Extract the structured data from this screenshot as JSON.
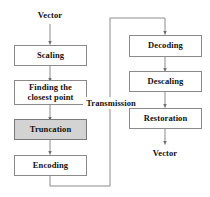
{
  "diagram": {
    "colors": {
      "node_border": "#8a8a8a",
      "node_fill": "#ffffff",
      "shaded_node_fill": "#d3d3d3",
      "edge": "#8a8a8a",
      "text": "#111111",
      "background": "#ffffff"
    },
    "labels": {
      "input_vector": "Vector",
      "output_vector": "Vector",
      "transmission": "Transmission"
    },
    "encoder_nodes": [
      {
        "id": "scaling",
        "label": "Scaling",
        "shaded": false
      },
      {
        "id": "finding-closest-point",
        "label": "Finding the closest point",
        "shaded": false
      },
      {
        "id": "truncation",
        "label": "Truncation",
        "shaded": true
      },
      {
        "id": "encoding",
        "label": "Encoding",
        "shaded": false
      }
    ],
    "decoder_nodes": [
      {
        "id": "decoding",
        "label": "Decoding",
        "shaded": false
      },
      {
        "id": "descaling",
        "label": "Descaling",
        "shaded": false
      },
      {
        "id": "restoration",
        "label": "Restoration",
        "shaded": false
      }
    ]
  }
}
